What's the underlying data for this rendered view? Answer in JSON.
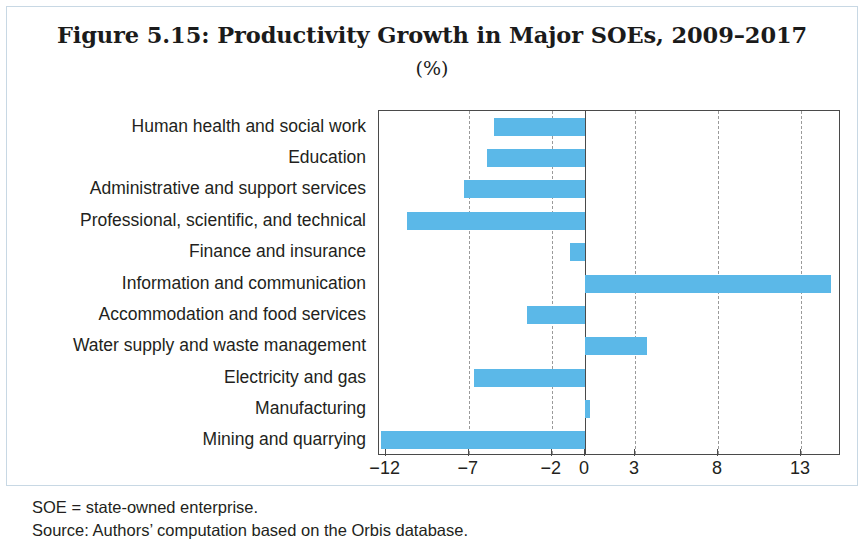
{
  "figure": {
    "title": "Figure 5.15: Productivity Growth in Major SOEs, 2009–2017",
    "subtitle": "(%)",
    "notes": [
      "SOE = state-owned enterprise.",
      "Source: Authors’ computation based on the Orbis database."
    ],
    "bar_color": "#5bb8e8",
    "axis_color": "#4a4a4a",
    "grid_color": "#9a9a9a"
  },
  "chart_data": {
    "type": "bar",
    "orientation": "horizontal",
    "title": "Figure 5.15: Productivity Growth in Major SOEs, 2009–2017",
    "subtitle": "(%)",
    "xlabel": "",
    "ylabel": "",
    "unit": "%",
    "categories": [
      "Human health and social work",
      "Education",
      "Administrative and support services",
      "Professional, scientific, and technical",
      "Finance and insurance",
      "Information and communication",
      "Accommodation and food services",
      "Water supply and waste management",
      "Electricity and gas",
      "Manufacturing",
      "Mining and quarrying"
    ],
    "values": [
      -5.5,
      -5.9,
      -7.3,
      -10.7,
      -0.9,
      14.8,
      -3.5,
      3.7,
      -6.7,
      0.3,
      -12.3
    ],
    "xlim": [
      -12.4,
      15.4
    ],
    "xticks": [
      -12,
      -7,
      -2,
      0,
      3,
      8,
      13
    ],
    "xticklabels": [
      "-12",
      "-7",
      "-2",
      "0",
      "3",
      "8",
      "13"
    ],
    "gridlines": [
      -7,
      -2,
      3,
      8,
      13
    ],
    "grid": true,
    "legend": "none",
    "series": [
      {
        "name": "Productivity growth",
        "values": [
          -5.5,
          -5.9,
          -7.3,
          -10.7,
          -0.9,
          14.8,
          -3.5,
          3.7,
          -6.7,
          0.3,
          -12.3
        ]
      }
    ]
  }
}
